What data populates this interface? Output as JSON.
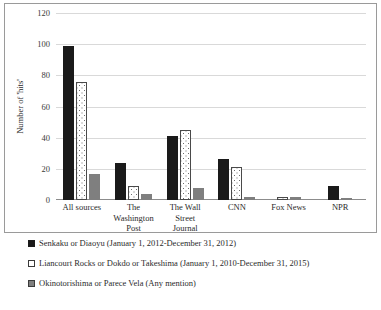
{
  "chart_data": {
    "type": "bar",
    "title": "",
    "xlabel": "",
    "ylabel": "Number of 'hits'",
    "ylim": [
      0,
      120
    ],
    "yticks": [
      0,
      20,
      40,
      60,
      80,
      100,
      120
    ],
    "grid": true,
    "legend_position": "bottom-left",
    "categories": [
      "All sources",
      "The Washington Post",
      "The Wall Street Journal",
      "CNN",
      "Fox News",
      "NPR"
    ],
    "category_lines": [
      [
        "All sources"
      ],
      [
        "The",
        "Washington",
        "Post"
      ],
      [
        "The Wall",
        "Street",
        "Journal"
      ],
      [
        "CNN"
      ],
      [
        "Fox News"
      ],
      [
        "NPR"
      ]
    ],
    "series": [
      {
        "name": "Senkaku or Diaoyu (January 1, 2012-December 31, 2012)",
        "style": "solid-black",
        "color": "#1a1a1a",
        "values": [
          99,
          24,
          41,
          26,
          0,
          9
        ]
      },
      {
        "name": "Liancourt Rocks or Dokdo or Takeshima (January 1, 2010-December 31, 2015)",
        "style": "white-dotted",
        "color": "#ffffff",
        "values": [
          76,
          9,
          45,
          21,
          2,
          0
        ]
      },
      {
        "name": "Okinotorishima or Parece Vela (Any mention)",
        "style": "solid-gray",
        "color": "#7f7f7f",
        "values": [
          17,
          4,
          8,
          2,
          2,
          1
        ]
      }
    ]
  }
}
